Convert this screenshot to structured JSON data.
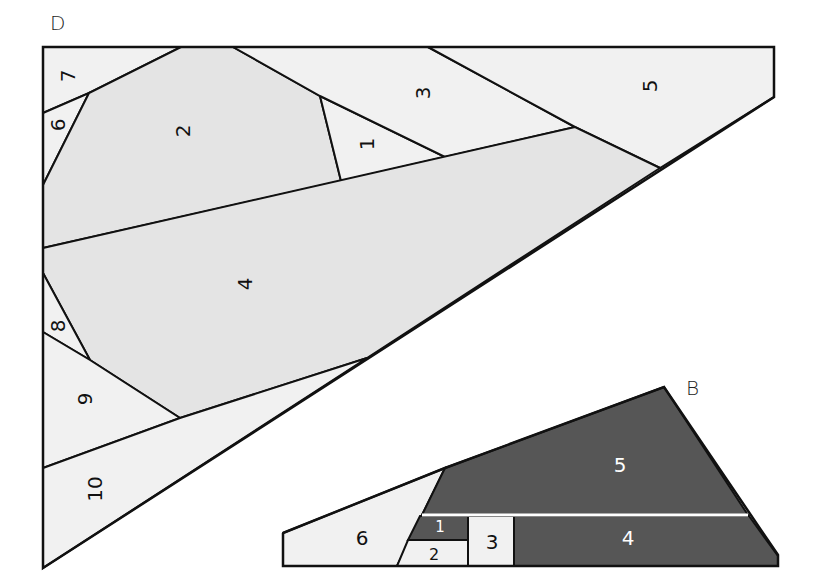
{
  "diagram": {
    "type": "paper-piecing pattern",
    "colors": {
      "light": "#f1f1f1",
      "medium": "#e4e4e4",
      "dark": "#565656",
      "line": "#111111",
      "divider_white": "#ffffff"
    },
    "sections": [
      {
        "name": "D",
        "label": "D",
        "pieces": [
          {
            "label": "1"
          },
          {
            "label": "2"
          },
          {
            "label": "3"
          },
          {
            "label": "4"
          },
          {
            "label": "5"
          },
          {
            "label": "6"
          },
          {
            "label": "7"
          },
          {
            "label": "8"
          },
          {
            "label": "9"
          },
          {
            "label": "10"
          }
        ]
      },
      {
        "name": "B",
        "label": "B",
        "pieces": [
          {
            "label": "1"
          },
          {
            "label": "2"
          },
          {
            "label": "3"
          },
          {
            "label": "4"
          },
          {
            "label": "5"
          },
          {
            "label": "6"
          }
        ]
      }
    ]
  }
}
